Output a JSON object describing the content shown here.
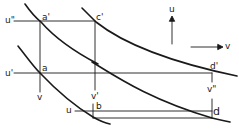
{
  "diagram": {
    "type": "indifference-curve-construction",
    "axes": {
      "up_label": "u",
      "right_label": "v"
    },
    "points": [
      {
        "id": "a_prime",
        "label": "a'"
      },
      {
        "id": "c_prime",
        "label": "c'"
      },
      {
        "id": "a",
        "label": "a"
      },
      {
        "id": "d_prime",
        "label": "d'"
      },
      {
        "id": "b",
        "label": "b"
      },
      {
        "id": "d",
        "label": "d"
      }
    ],
    "level_labels": {
      "u_double_prime": "u\"",
      "u_prime": "u'",
      "u": "u",
      "v": "v",
      "v_prime": "v'",
      "v_double_prime": "v\""
    },
    "colors": {
      "ink": "#1a1a1a",
      "background": "#ffffff"
    }
  }
}
